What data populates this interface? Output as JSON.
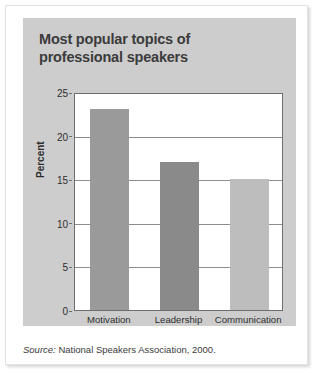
{
  "figure": {
    "title": "Most popular topics of professional speakers",
    "source_label": "Source:",
    "source_text": " National Speakers Association, 2000."
  },
  "chart_data": {
    "type": "bar",
    "title": "Most popular topics of professional speakers",
    "categories": [
      "Motivation",
      "Leadership",
      "Communication"
    ],
    "values": [
      23,
      17,
      15
    ],
    "series": [
      {
        "name": "Percent",
        "values": [
          23,
          17,
          15
        ]
      }
    ],
    "xlabel": "",
    "ylabel": "Percent",
    "ylim": [
      0,
      25
    ],
    "yticks": [
      0,
      5,
      10,
      15,
      20,
      25
    ],
    "ytick_labels": [
      "0",
      "5",
      "10",
      "15",
      "20",
      "25"
    ],
    "grid": true,
    "grid_axis": "y",
    "legend": false,
    "bar_colors": [
      "#9a9a9a",
      "#8a8a8a",
      "#bdbdbd"
    ],
    "panel_color": "#cdcdcd",
    "plot_bg": "#ffffff",
    "axis_color": "#6e6e6e",
    "text_color": "#2e2e2e"
  },
  "y_axis": {
    "title": "Percent",
    "ticks": [
      {
        "value": 25,
        "label": "25"
      },
      {
        "value": 20,
        "label": "20"
      },
      {
        "value": 15,
        "label": "15"
      },
      {
        "value": 10,
        "label": "10"
      },
      {
        "value": 5,
        "label": "5"
      },
      {
        "value": 0,
        "label": "0"
      }
    ]
  },
  "bars": [
    {
      "label": "Motivation",
      "value": 23,
      "color": "#9a9a9a"
    },
    {
      "label": "Leadership",
      "value": 17,
      "color": "#8a8a8a"
    },
    {
      "label": "Communication",
      "value": 15,
      "color": "#bdbdbd"
    }
  ]
}
